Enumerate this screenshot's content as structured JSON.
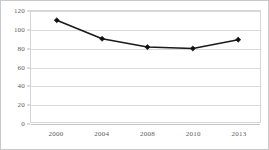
{
  "chart_data": {
    "type": "line",
    "title": "",
    "subtitle": "",
    "xlabel": "",
    "ylabel": "",
    "categories": [
      "2000",
      "2004",
      "2008",
      "2010",
      "2013"
    ],
    "values": [
      110,
      90,
      81,
      79.5,
      89
    ],
    "series": [
      {
        "name": "",
        "values": [
          110,
          90,
          81,
          79.5,
          89
        ]
      }
    ],
    "ylim": [
      0,
      120
    ],
    "yticks": [
      0,
      20,
      40,
      60,
      80,
      100,
      120
    ],
    "ytick_labels": [
      "0",
      "20",
      "40",
      "60",
      "80",
      "100",
      "120"
    ],
    "xtick_labels": [
      "2000",
      "2004",
      "2008",
      "2010",
      "2013"
    ],
    "grid": true,
    "grid_axis": "y",
    "legend": false,
    "legend_position": "none",
    "marker": "diamond",
    "colors": {
      "line": "#1a1a1a",
      "marker": "#111111",
      "grid": "#d9d9d9",
      "axis_text": "#5b5b5b",
      "plot_border": "#d5d5d5",
      "frame_border": "#c9c9c9",
      "background": "#ffffff"
    }
  }
}
